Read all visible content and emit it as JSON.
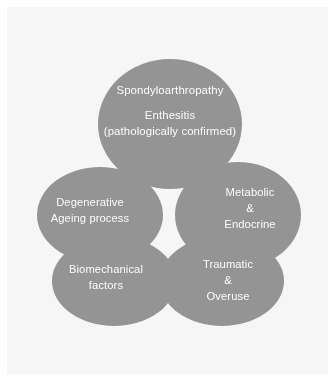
{
  "figure": {
    "type": "venn-petal-diagram",
    "title": "",
    "background_color": "#f6f6f6",
    "page_color": "#ffffff",
    "ellipse_fill": "#9a9a9a",
    "ellipse_overlap_fill": "#6f6f6f",
    "label_color": "#ffffff"
  },
  "ellipses": [
    {
      "id": "spondyloarthropathy",
      "name": "top-ellipse",
      "lines": [
        "Spondyloarthropathy",
        "Enthesitis",
        "(pathologically confirmed)"
      ],
      "cx": 170,
      "cy": 124,
      "rx": 72,
      "ry": 65
    },
    {
      "id": "degenerative",
      "name": "left-ellipse",
      "lines": [
        "Degenerative",
        "Ageing process"
      ],
      "cx": 100,
      "cy": 215,
      "rx": 63,
      "ry": 48
    },
    {
      "id": "metabolic",
      "name": "right-ellipse",
      "lines": [
        "Metabolic",
        "&",
        "Endocrine"
      ],
      "cx": 238,
      "cy": 215,
      "rx": 63,
      "ry": 53
    },
    {
      "id": "biomechanical",
      "name": "bottom-left-ellipse",
      "lines": [
        "Biomechanical",
        "factors"
      ],
      "cx": 114,
      "cy": 281,
      "rx": 62,
      "ry": 45
    },
    {
      "id": "traumatic",
      "name": "bottom-right-ellipse",
      "lines": [
        "Traumatic",
        "&",
        "Overuse"
      ],
      "cx": 222,
      "cy": 281,
      "rx": 62,
      "ry": 45
    }
  ],
  "labels": {
    "spondyloarthropathy": {
      "line1": "Spondyloarthropathy",
      "line2": "Enthesitis",
      "line3": "(pathologically confirmed)"
    },
    "degenerative": {
      "line1": "Degenerative",
      "line2": "Ageing process"
    },
    "metabolic": {
      "line1": "Metabolic",
      "line2": "&",
      "line3": "Endocrine"
    },
    "biomechanical": {
      "line1": "Biomechanical",
      "line2": "factors"
    },
    "traumatic": {
      "line1": "Traumatic",
      "line2": "&",
      "line3": "Overuse"
    }
  }
}
